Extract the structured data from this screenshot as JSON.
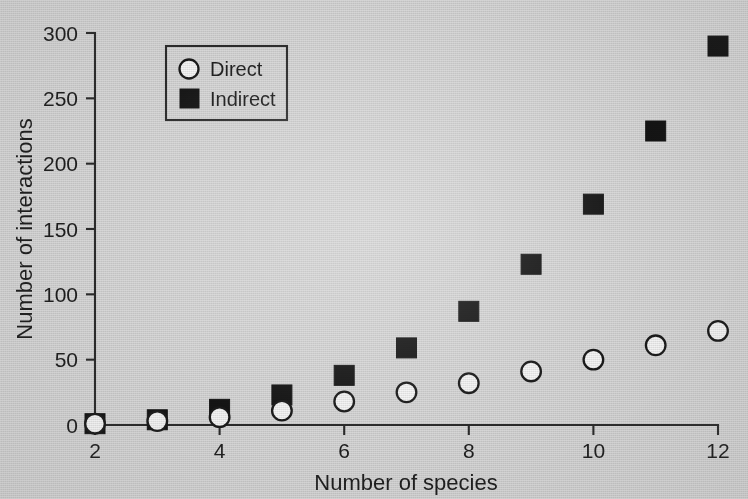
{
  "chart_data": {
    "type": "scatter",
    "title": "",
    "xlabel": "Number of species",
    "ylabel": "Number of interactions",
    "x": [
      2,
      3,
      4,
      5,
      6,
      7,
      8,
      9,
      10,
      11,
      12
    ],
    "xlim": [
      2,
      12
    ],
    "ylim": [
      0,
      300
    ],
    "xticks": [
      2,
      4,
      6,
      8,
      10,
      12
    ],
    "yticks": [
      0,
      50,
      100,
      150,
      200,
      250,
      300
    ],
    "xticklabels": [
      "2",
      "4",
      "6",
      "8",
      "10",
      "12"
    ],
    "yticklabels": [
      "0",
      "50",
      "100",
      "150",
      "200",
      "250",
      "300"
    ],
    "grid": false,
    "legend_position": "upper left",
    "series": [
      {
        "name": "Direct",
        "marker": "open-circle",
        "color": "#f4f4f4",
        "edge_color": "#1a1a1a",
        "values": [
          1,
          3,
          6,
          11,
          18,
          25,
          32,
          41,
          50,
          61,
          72
        ]
      },
      {
        "name": "Indirect",
        "marker": "filled-square",
        "color": "#141414",
        "edge_color": "#141414",
        "values": [
          1,
          4,
          12,
          23,
          38,
          59,
          87,
          123,
          169,
          225,
          290
        ]
      }
    ]
  },
  "legend": {
    "entries": [
      {
        "label": "Direct",
        "marker": "open-circle"
      },
      {
        "label": "Indirect",
        "marker": "filled-square"
      }
    ]
  },
  "axes": {
    "x_title": "Number of species",
    "y_title": "Number of interactions"
  }
}
